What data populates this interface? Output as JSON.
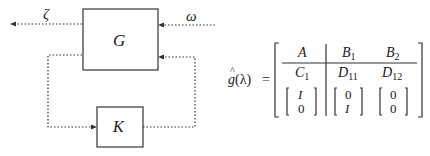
{
  "diagram": {
    "blocks": [
      {
        "id": "G",
        "label": "G"
      },
      {
        "id": "K",
        "label": "K"
      }
    ],
    "signals": {
      "output_label": "ζ",
      "input_label": "ω"
    }
  },
  "equation": {
    "lhs": "ĝ(λ) =",
    "lhs_func": "g",
    "lhs_arg": "(λ)",
    "equals": "=",
    "matrix": {
      "row0": {
        "c0": "A",
        "c1_base": "B",
        "c1_sub": "1",
        "c2_base": "B",
        "c2_sub": "2"
      },
      "row1": {
        "c0_base": "C",
        "c0_sub": "1",
        "c1_base": "D",
        "c1_sub": "11",
        "c2_base": "D",
        "c2_sub": "12"
      },
      "row2": {
        "c0": [
          "I",
          "0"
        ],
        "c1": [
          "0",
          "I"
        ],
        "c2": [
          "0",
          "0"
        ]
      }
    }
  },
  "colors": {
    "line": "#333333",
    "text": "#1a1a1a"
  }
}
